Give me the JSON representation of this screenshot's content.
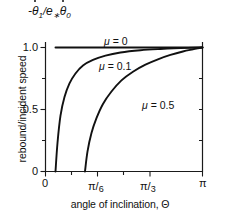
{
  "chart_data": {
    "type": "line",
    "title": "",
    "xlabel": "angle of inclination, Θ",
    "ylabel": "rebound/incident speed",
    "ylabel_top": "-θ̇₁/e∗θ̇₀",
    "xlim": [
      0,
      3.14159
    ],
    "ylim": [
      0,
      1.08
    ],
    "xtick_values": [
      0,
      0.5236,
      1.0472,
      3.14159
    ],
    "xtick_labels": [
      "0",
      "π/6",
      "π/3",
      "π"
    ],
    "ytick_values": [
      0,
      0.5,
      1.0
    ],
    "ytick_labels": [
      "0",
      "0.5",
      "1.0"
    ],
    "yminor_values": [
      0.25,
      0.75
    ],
    "grid": false,
    "legend_position": "inline-annotations",
    "series": [
      {
        "name": "μ = 0",
        "label": "μ = 0",
        "mu": 0,
        "x": [
          0.2,
          0.4,
          0.7,
          1.0,
          1.4,
          1.8,
          2.2,
          2.6,
          3.0,
          3.14159
        ],
        "y": [
          1.0,
          1.0,
          1.0,
          1.0,
          1.0,
          1.0,
          1.0,
          1.0,
          1.0,
          1.0
        ]
      },
      {
        "name": "μ = 0.1",
        "label": "μ = 0.1",
        "mu": 0.1,
        "x": [
          0.2,
          0.24,
          0.3,
          0.38,
          0.48,
          0.6,
          0.75,
          0.95,
          1.2,
          1.5,
          1.9,
          2.3,
          2.7,
          3.0,
          3.14159
        ],
        "y": [
          0.0,
          0.23,
          0.45,
          0.6,
          0.71,
          0.79,
          0.855,
          0.9,
          0.935,
          0.96,
          0.978,
          0.988,
          0.995,
          0.999,
          1.0
        ]
      },
      {
        "name": "μ = 0.5",
        "label": "μ = 0.5",
        "mu": 0.5,
        "x": [
          0.79,
          0.84,
          0.92,
          1.02,
          1.15,
          1.32,
          1.52,
          1.75,
          2.0,
          2.25,
          2.5,
          2.75,
          2.95,
          3.08,
          3.14159
        ],
        "y": [
          0.0,
          0.16,
          0.31,
          0.43,
          0.545,
          0.645,
          0.735,
          0.805,
          0.862,
          0.905,
          0.94,
          0.968,
          0.985,
          0.996,
          1.0
        ]
      }
    ],
    "annotations": [
      {
        "text": "μ = 0",
        "x": 1.32,
        "y": 1.055
      },
      {
        "text": "μ = 0.1",
        "x": 1.22,
        "y": 0.875
      },
      {
        "text": "μ = 0.5",
        "x": 2.08,
        "y": 0.615
      }
    ]
  },
  "axis": {
    "ylabel_rot": "rebound/incident speed",
    "xlabel": "angle of inclination, Θ",
    "top_label_parts": {
      "minus": "-",
      "theta1": "θ",
      "sub1": "1",
      "slash": "/",
      "e": "e",
      "star": "∗",
      "theta0": "θ",
      "sub0": "0"
    }
  },
  "ticks": {
    "y": [
      {
        "label": "1.0"
      },
      {
        "label": "0.5"
      },
      {
        "label": "0"
      }
    ],
    "x": [
      {
        "label": "0",
        "num": "",
        "den": ""
      },
      {
        "label": "",
        "num": "π",
        "den": "6"
      },
      {
        "label": "",
        "num": "π",
        "den": "3"
      },
      {
        "label": "π",
        "num": "",
        "den": ""
      }
    ]
  },
  "curve_labels": {
    "mu0": {
      "mu": "μ",
      "eq": " = ",
      "value": "0"
    },
    "mu01": {
      "mu": "μ",
      "eq": " = ",
      "value": "0.1"
    },
    "mu05": {
      "mu": "μ",
      "eq": " = ",
      "value": "0.5"
    }
  }
}
